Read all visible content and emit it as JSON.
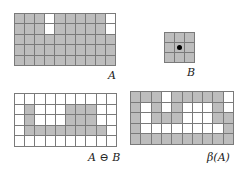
{
  "figure": {
    "colors": {
      "foreground": "#bdbdbd",
      "background": "#ffffff",
      "gridline": "#7a7a7a",
      "origin_dot": "#000000"
    },
    "panels": [
      {
        "id": "A",
        "label": "A",
        "rows": 5,
        "cols": 10,
        "cells": [
          [
            1,
            1,
            1,
            0,
            1,
            1,
            1,
            1,
            1,
            0
          ],
          [
            1,
            1,
            1,
            0,
            1,
            1,
            1,
            1,
            1,
            0
          ],
          [
            1,
            1,
            1,
            1,
            1,
            1,
            1,
            1,
            1,
            1
          ],
          [
            1,
            1,
            1,
            1,
            1,
            1,
            1,
            1,
            1,
            1
          ],
          [
            1,
            1,
            1,
            1,
            1,
            1,
            1,
            1,
            1,
            1
          ]
        ]
      },
      {
        "id": "B",
        "label": "B",
        "rows": 3,
        "cols": 3,
        "cells": [
          [
            1,
            1,
            1
          ],
          [
            1,
            1,
            1
          ],
          [
            1,
            1,
            1
          ]
        ],
        "origin": [
          1,
          1
        ]
      },
      {
        "id": "erosion",
        "label": "A ⊖ B",
        "rows": 5,
        "cols": 10,
        "cells": [
          [
            0,
            0,
            0,
            0,
            0,
            0,
            0,
            0,
            0,
            0
          ],
          [
            0,
            1,
            0,
            0,
            0,
            1,
            1,
            1,
            0,
            0
          ],
          [
            0,
            1,
            0,
            0,
            0,
            1,
            1,
            1,
            0,
            0
          ],
          [
            0,
            1,
            1,
            1,
            1,
            1,
            1,
            1,
            1,
            0
          ],
          [
            0,
            0,
            0,
            0,
            0,
            0,
            0,
            0,
            0,
            0
          ]
        ]
      },
      {
        "id": "boundary",
        "label": "β(A)",
        "rows": 5,
        "cols": 10,
        "cells": [
          [
            1,
            1,
            1,
            0,
            1,
            1,
            1,
            1,
            1,
            0
          ],
          [
            1,
            0,
            1,
            0,
            1,
            0,
            0,
            0,
            1,
            0
          ],
          [
            1,
            0,
            1,
            1,
            1,
            0,
            0,
            0,
            1,
            1
          ],
          [
            1,
            0,
            0,
            0,
            0,
            0,
            0,
            0,
            0,
            1
          ],
          [
            1,
            1,
            1,
            1,
            1,
            1,
            1,
            1,
            1,
            1
          ]
        ]
      }
    ]
  }
}
